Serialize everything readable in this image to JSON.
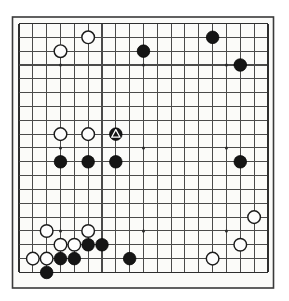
{
  "figure": {
    "kind": "go-board-diagram",
    "board_size": 19,
    "background_color": "#ffffff",
    "board_color": "#fbfbf9",
    "line_color": "#4a4a4a",
    "border_color": "#2e2e2e",
    "black_stone_color": "#151515",
    "white_stone_color": "#fdfdfd",
    "mark_color": "#ffffff"
  },
  "geometry": {
    "origin_x": 19.0,
    "origin_y": 23.5,
    "spacing": 13.83,
    "stone_radius": 6.3,
    "hoshi_radius": 1.5,
    "border_left": 12.5,
    "border_top": 17.0,
    "border_width": 261.0,
    "border_height": 271.0
  },
  "chart_data": {
    "type": "scatter",
    "xlabel": "",
    "ylabel": "",
    "board_size": 19,
    "hoshi_points": [
      [
        3,
        3
      ],
      [
        9,
        3
      ],
      [
        15,
        3
      ],
      [
        3,
        9
      ],
      [
        9,
        9
      ],
      [
        15,
        9
      ],
      [
        3,
        15
      ],
      [
        9,
        15
      ],
      [
        15,
        15
      ]
    ],
    "series": [
      {
        "name": "Black",
        "color": "#151515",
        "values": [
          [
            9,
            2
          ],
          [
            14,
            1
          ],
          [
            16,
            3
          ],
          [
            7,
            8
          ],
          [
            3,
            10
          ],
          [
            5,
            10
          ],
          [
            7,
            10
          ],
          [
            16,
            10
          ],
          [
            5,
            16
          ],
          [
            6,
            16
          ],
          [
            3,
            17
          ],
          [
            4,
            17
          ],
          [
            8,
            17
          ],
          [
            2,
            18
          ]
        ]
      },
      {
        "name": "White",
        "color": "#fdfdfd",
        "values": [
          [
            3,
            2
          ],
          [
            5,
            1
          ],
          [
            3,
            8
          ],
          [
            5,
            8
          ],
          [
            2,
            15
          ],
          [
            5,
            15
          ],
          [
            3,
            16
          ],
          [
            4,
            16
          ],
          [
            1,
            17
          ],
          [
            2,
            17
          ],
          [
            17,
            14
          ],
          [
            16,
            16
          ],
          [
            14,
            17
          ]
        ]
      }
    ],
    "marks": [
      {
        "type": "triangle",
        "point": [
          7,
          8
        ],
        "on": "black"
      }
    ]
  },
  "labels": {
    "black_stone_name": "black-stone",
    "white_stone_name": "white-stone",
    "marked_stone_name": "triangle-marked-black-stone",
    "hoshi_name": "star-point"
  }
}
